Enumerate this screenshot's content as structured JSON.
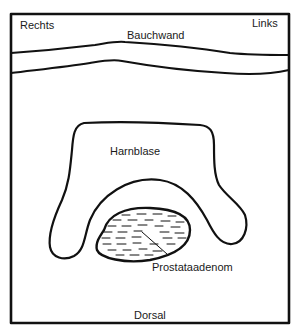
{
  "diagram": {
    "type": "anatomical-cross-section",
    "labels": {
      "right": "Rechts",
      "left": "Links",
      "abdominal_wall": "Bauchwand",
      "bladder": "Harnblase",
      "prostate_adenoma": "Prostataadenom",
      "dorsal": "Dorsal"
    },
    "colors": {
      "line": "#111111",
      "background": "#ffffff",
      "text": "#1a1a1a"
    }
  }
}
